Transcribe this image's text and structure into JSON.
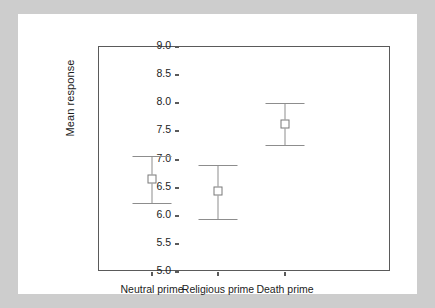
{
  "chart_data": {
    "type": "scatter",
    "title": "",
    "subtitle": "",
    "xlabel": "",
    "ylabel": "Mean response",
    "ylim": [
      5.0,
      9.0
    ],
    "ytick_labels": [
      "9.0",
      "8.5",
      "8.0",
      "7.5",
      "7.0",
      "6.5",
      "6.0",
      "5.5",
      "5.0"
    ],
    "ytick_values": [
      9.0,
      8.5,
      8.0,
      7.5,
      7.0,
      6.5,
      6.0,
      5.5,
      5.0
    ],
    "grid": false,
    "legend": "none",
    "categories": [
      "Neutral prime",
      "Religious prime",
      "Death prime"
    ],
    "values": [
      6.65,
      6.44,
      7.63
    ],
    "error_low": [
      6.23,
      5.95,
      7.25
    ],
    "error_high": [
      7.07,
      6.91,
      8.01
    ],
    "series": [
      {
        "name": "Mean response",
        "points": [
          {
            "category": "Neutral prime",
            "value": 6.65,
            "low": 6.23,
            "high": 7.07
          },
          {
            "category": "Religious prime",
            "value": 6.44,
            "low": 5.95,
            "high": 6.91
          },
          {
            "category": "Death prime",
            "value": 7.63,
            "low": 7.25,
            "high": 8.01
          }
        ]
      }
    ],
    "colors": {
      "axis": "#5a5a5a",
      "errorbar": "#8d8d8d",
      "marker_fill": "#ffffff",
      "marker_edge": "#787878",
      "text": "#1c1c1c",
      "panel_background": "#ffffff",
      "page_background": "#cdcdcd"
    }
  }
}
